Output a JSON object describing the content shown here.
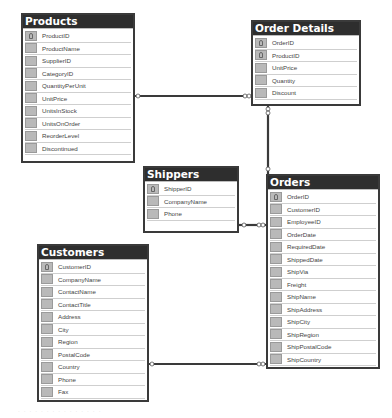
{
  "tables": {
    "products": {
      "title": "Products",
      "columns": [
        {
          "name": "ProductID",
          "pk": true
        },
        {
          "name": "ProductName",
          "pk": false
        },
        {
          "name": "SupplierID",
          "pk": false
        },
        {
          "name": "CategoryID",
          "pk": false
        },
        {
          "name": "QuantityPerUnit",
          "pk": false
        },
        {
          "name": "UnitPrice",
          "pk": false
        },
        {
          "name": "UnitsInStock",
          "pk": false
        },
        {
          "name": "UnitsOnOrder",
          "pk": false
        },
        {
          "name": "ReorderLevel",
          "pk": false
        },
        {
          "name": "Discontinued",
          "pk": false
        }
      ]
    },
    "order_details": {
      "title": "Order Details",
      "columns": [
        {
          "name": "OrderID",
          "pk": true
        },
        {
          "name": "ProductID",
          "pk": true
        },
        {
          "name": "UnitPrice",
          "pk": false
        },
        {
          "name": "Quantity",
          "pk": false
        },
        {
          "name": "Discount",
          "pk": false
        }
      ]
    },
    "shippers": {
      "title": "Shippers",
      "columns": [
        {
          "name": "ShipperID",
          "pk": true
        },
        {
          "name": "CompanyName",
          "pk": false
        },
        {
          "name": "Phone",
          "pk": false
        }
      ]
    },
    "orders": {
      "title": "Orders",
      "columns": [
        {
          "name": "OrderID",
          "pk": true
        },
        {
          "name": "CustomerID",
          "pk": false
        },
        {
          "name": "EmployeeID",
          "pk": false
        },
        {
          "name": "OrderDate",
          "pk": false
        },
        {
          "name": "RequiredDate",
          "pk": false
        },
        {
          "name": "ShippedDate",
          "pk": false
        },
        {
          "name": "ShipVia",
          "pk": false
        },
        {
          "name": "Freight",
          "pk": false
        },
        {
          "name": "ShipName",
          "pk": false
        },
        {
          "name": "ShipAddress",
          "pk": false
        },
        {
          "name": "ShipCity",
          "pk": false
        },
        {
          "name": "ShipRegion",
          "pk": false
        },
        {
          "name": "ShipPostalCode",
          "pk": false
        },
        {
          "name": "ShipCountry",
          "pk": false
        }
      ]
    },
    "customers": {
      "title": "Customers",
      "columns": [
        {
          "name": "CustomerID",
          "pk": true
        },
        {
          "name": "CompanyName",
          "pk": false
        },
        {
          "name": "ContactName",
          "pk": false
        },
        {
          "name": "ContactTitle",
          "pk": false
        },
        {
          "name": "Address",
          "pk": false
        },
        {
          "name": "City",
          "pk": false
        },
        {
          "name": "Region",
          "pk": false
        },
        {
          "name": "PostalCode",
          "pk": false
        },
        {
          "name": "Country",
          "pk": false
        },
        {
          "name": "Phone",
          "pk": false
        },
        {
          "name": "Fax",
          "pk": false
        }
      ]
    }
  },
  "relationships": [
    {
      "from": "Products",
      "to": "Order Details",
      "from_end": "one",
      "to_end": "many"
    },
    {
      "from": "Orders",
      "to": "Order Details",
      "from_end": "one",
      "to_end": "many"
    },
    {
      "from": "Shippers",
      "to": "Orders",
      "from_end": "one",
      "to_end": "many"
    },
    {
      "from": "Customers",
      "to": "Orders",
      "from_end": "one",
      "to_end": "many"
    }
  ],
  "caption": "· · ·  · ·  · · · · · ·  · · · ·"
}
